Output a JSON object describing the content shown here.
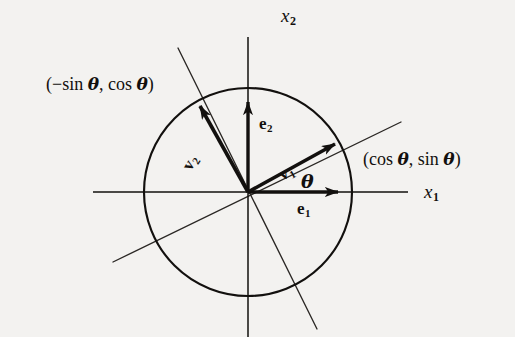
{
  "figure": {
    "kind": "math-diagram",
    "background_color": "#f3f2f0",
    "ink_color": "#12100e"
  },
  "axes": {
    "x_axis": {
      "name": "x1",
      "label": "x",
      "subscript": "1"
    },
    "y_axis": {
      "name": "x2",
      "label": "x",
      "subscript": "2"
    }
  },
  "circle": {
    "center_x": 248,
    "center_y": 192,
    "radius": 104,
    "stroke_width": 2.1
  },
  "vectors": [
    {
      "id": "e1",
      "label": "e",
      "subscript": "1",
      "angle_deg": 0,
      "length": 100,
      "style": "bold-arrow"
    },
    {
      "id": "e2",
      "label": "e",
      "subscript": "2",
      "angle_deg": 90,
      "length": 100,
      "style": "bold-arrow"
    },
    {
      "id": "v1",
      "label": "v",
      "subscript": "1",
      "angle_deg": 29,
      "length": 111,
      "style": "bold-arrow"
    },
    {
      "id": "v2",
      "label": "v",
      "subscript": "2",
      "angle_deg": 119,
      "length": 111,
      "style": "bold-arrow"
    }
  ],
  "angle_mark": {
    "id": "theta",
    "label": "θ",
    "between": [
      "e1",
      "v1"
    ]
  },
  "coordinate_labels": [
    {
      "id": "v1-coords",
      "prefix": "(cos ",
      "theta": "θ",
      "middle": ", sin ",
      "theta2": "θ",
      "suffix": ")",
      "full": "(cos θ, sin θ)"
    },
    {
      "id": "v2-coords",
      "prefix": "(−sin ",
      "theta": "θ",
      "middle": ", cos ",
      "theta2": "θ",
      "suffix": ")",
      "full": "(−sin θ, cos θ)"
    }
  ],
  "guide_lines": [
    {
      "id": "v1-extension",
      "from_x": 113,
      "from_y": 262,
      "to_x": 401,
      "to_y": 122
    },
    {
      "id": "v2-extension",
      "from_x": 178,
      "from_y": 48,
      "to_x": 317,
      "to_y": 329
    }
  ]
}
